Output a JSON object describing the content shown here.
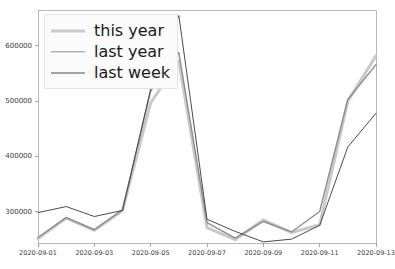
{
  "chart_data": {
    "type": "line",
    "title": "",
    "xlabel": "",
    "ylabel": "",
    "x": [
      "2020-09-01",
      "2020-09-02",
      "2020-09-03",
      "2020-09-04",
      "2020-09-05",
      "2020-09-06",
      "2020-09-07",
      "2020-09-08",
      "2020-09-09",
      "2020-09-10",
      "2020-09-11",
      "2020-09-12",
      "2020-09-13"
    ],
    "xtick_labels": [
      "2020-09-01",
      "2020-09-03",
      "2020-09-05",
      "2020-09-07",
      "2020-09-09",
      "2020-09-11",
      "2020-09-13"
    ],
    "xtick_indices": [
      0,
      2,
      4,
      6,
      8,
      10,
      12
    ],
    "ytick_labels": [
      "300000",
      "400000",
      "500000",
      "600000"
    ],
    "ytick_values": [
      300000,
      400000,
      500000,
      600000
    ],
    "ylim": [
      243000,
      665000
    ],
    "xlim": [
      0,
      12
    ],
    "grid": false,
    "legend_position": "upper left",
    "series": [
      {
        "name": "this year",
        "color": "#c9c9c9",
        "width": 3.0,
        "values": [
          251000,
          288000,
          266000,
          302000,
          497000,
          572000,
          271000,
          249000,
          285000,
          262000,
          276000,
          500000,
          582000
        ]
      },
      {
        "name": "last year",
        "color": "#8d8d8d",
        "width": 1.4,
        "values": [
          253000,
          289000,
          267000,
          303000,
          518000,
          588000,
          280000,
          252000,
          282000,
          263000,
          300000,
          503000,
          566000
        ]
      },
      {
        "name": "last week",
        "color": "#4a4a4a",
        "width": 1.0,
        "values": [
          298000,
          309000,
          291000,
          302000,
          522000,
          655000,
          286000,
          264000,
          245000,
          250000,
          275000,
          417000,
          478000
        ]
      }
    ]
  },
  "legend": {
    "entries": [
      {
        "label": "this year"
      },
      {
        "label": "last year"
      },
      {
        "label": "last week"
      }
    ]
  },
  "axes": {
    "spine_color": "#b0b0b0",
    "tick_color": "#9a9a9a",
    "tick_text_color": "#3b3b3b"
  }
}
